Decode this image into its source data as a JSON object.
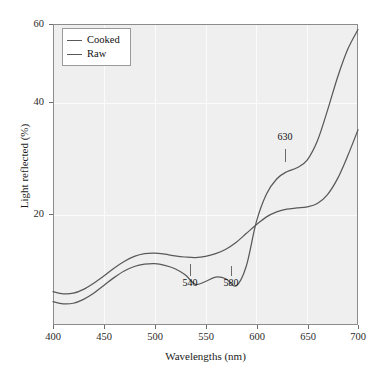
{
  "chart_data": {
    "type": "line",
    "title": "",
    "xlabel": "Wavelengths (nm)",
    "ylabel": "Light reflected (%)",
    "xlim": [
      400,
      700
    ],
    "ylim": [
      6,
      60
    ],
    "xticks": [
      400,
      450,
      500,
      550,
      600,
      650,
      700
    ],
    "yticks": [
      20,
      40,
      60
    ],
    "grid": true,
    "legend_position": "top-left",
    "series": [
      {
        "name": "Cooked",
        "x": [
          400,
          410,
          420,
          430,
          440,
          450,
          460,
          470,
          480,
          490,
          500,
          510,
          520,
          530,
          540,
          550,
          560,
          570,
          580,
          590,
          600,
          610,
          620,
          630,
          640,
          650,
          660,
          670,
          680,
          690,
          700
        ],
        "values": [
          12.0,
          11.6,
          11.7,
          12.4,
          13.5,
          14.8,
          16.2,
          17.4,
          18.3,
          18.8,
          18.9,
          18.7,
          18.4,
          18.2,
          18.1,
          18.3,
          18.8,
          19.6,
          20.8,
          22.4,
          24.0,
          25.4,
          26.3,
          26.8,
          27.0,
          27.2,
          27.8,
          29.4,
          32.3,
          36.4,
          41.0
        ]
      },
      {
        "name": "Raw",
        "x": [
          400,
          410,
          420,
          430,
          440,
          450,
          460,
          470,
          480,
          490,
          500,
          510,
          520,
          530,
          540,
          550,
          560,
          570,
          580,
          590,
          600,
          610,
          620,
          630,
          640,
          650,
          660,
          670,
          680,
          690,
          700
        ],
        "values": [
          10.2,
          9.8,
          9.9,
          10.6,
          11.7,
          13.1,
          14.5,
          15.7,
          16.5,
          16.9,
          17.0,
          16.7,
          16.1,
          15.0,
          13.3,
          13.8,
          14.6,
          14.3,
          13.0,
          16.5,
          24.5,
          29.5,
          32.2,
          33.5,
          34.2,
          35.6,
          39.0,
          44.5,
          50.5,
          55.5,
          59.0
        ]
      }
    ],
    "annotations": [
      {
        "label": "540",
        "x": 540,
        "y": 13.3,
        "note": "local minimum on Raw curve"
      },
      {
        "label": "580",
        "x": 580,
        "y": 13.0,
        "note": "local minimum on Raw curve"
      },
      {
        "label": "630",
        "x": 630,
        "y": 33.5,
        "note": "shoulder on Raw curve"
      }
    ],
    "colors": {
      "line": "#595959",
      "panel_background": "#efefef",
      "gridline": "#fbfbfb",
      "panel_border": "#8c8c8c",
      "text": "#1a1a1a"
    }
  },
  "legend": {
    "entries": [
      {
        "label": "Cooked"
      },
      {
        "label": "Raw"
      }
    ]
  },
  "axis": {
    "x_tick_labels": [
      "400",
      "450",
      "500",
      "550",
      "600",
      "650",
      "700"
    ],
    "y_tick_labels": [
      "20",
      "40",
      "60"
    ],
    "x_title": "Wavelengths (nm)",
    "y_title": "Light reflected (%)"
  },
  "annotations": {
    "a540": "540",
    "a580": "580",
    "a630": "630"
  }
}
